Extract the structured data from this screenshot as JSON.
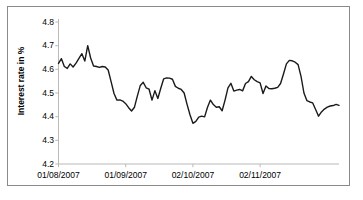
{
  "figure": {
    "background_color": "#ffffff",
    "border_color": "#8a8a8a"
  },
  "chart_data": {
    "type": "line",
    "title": "",
    "subtitle": "",
    "xlabel": "",
    "ylabel": "Interest rate in %",
    "ylim": [
      4.2,
      4.8
    ],
    "ytick_labels": [
      "4.8",
      "4.7",
      "4.6",
      "4.5",
      "4.4",
      "4.3",
      "4.2"
    ],
    "ytick_values": [
      4.8,
      4.7,
      4.6,
      4.5,
      4.4,
      4.3,
      4.2
    ],
    "xtick_labels": [
      "01/08/2007",
      "01/09/2007",
      "02/10/2007",
      "02/11/2007"
    ],
    "xtick_positions": [
      0,
      23,
      46,
      69
    ],
    "grid": false,
    "legend": "none",
    "line_color": "#1a1a1a",
    "line_width": 1.4,
    "series": [
      {
        "name": "Interest rate",
        "values": [
          4.625,
          4.645,
          4.612,
          4.604,
          4.623,
          4.61,
          4.626,
          4.646,
          4.666,
          4.635,
          4.7,
          4.648,
          4.614,
          4.612,
          4.608,
          4.612,
          4.61,
          4.597,
          4.548,
          4.498,
          4.47,
          4.471,
          4.466,
          4.455,
          4.438,
          4.424,
          4.44,
          4.488,
          4.532,
          4.545,
          4.522,
          4.516,
          4.47,
          4.51,
          4.477,
          4.52,
          4.56,
          4.564,
          4.563,
          4.558,
          4.528,
          4.52,
          4.515,
          4.5,
          4.452,
          4.408,
          4.372,
          4.38,
          4.398,
          4.402,
          4.399,
          4.44,
          4.47,
          4.451,
          4.44,
          4.442,
          4.425,
          4.47,
          4.522,
          4.541,
          4.508,
          4.512,
          4.515,
          4.509,
          4.54,
          4.548,
          4.57,
          4.556,
          4.548,
          4.543,
          4.498,
          4.53,
          4.519,
          4.518,
          4.52,
          4.524,
          4.54,
          4.58,
          4.623,
          4.638,
          4.636,
          4.63,
          4.62,
          4.57,
          4.5,
          4.468,
          4.462,
          4.458,
          4.43,
          4.402,
          4.42,
          4.432,
          4.44,
          4.445,
          4.447,
          4.452,
          4.448
        ]
      }
    ]
  }
}
